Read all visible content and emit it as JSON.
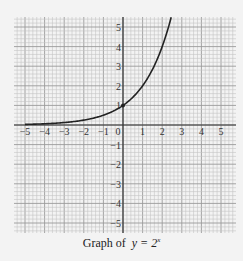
{
  "caption": {
    "prefix": "Graph of",
    "equation": "y = 2",
    "exponent": "x"
  },
  "chart_data": {
    "type": "line",
    "function": "y = 2^x",
    "xlabel": "",
    "ylabel": "",
    "xlim": [
      -5.5,
      5.5
    ],
    "ylim": [
      -5.5,
      5.5
    ],
    "grid": true,
    "minor_grid_per_unit": 5,
    "x_tick_labels": [
      "-5",
      "-4",
      "-3",
      "-2",
      "-1",
      "0",
      "1",
      "2",
      "3",
      "4",
      "5"
    ],
    "y_tick_labels": [
      "5",
      "4",
      "3",
      "2",
      "1",
      "-1",
      "-2",
      "-3",
      "-4",
      "-5"
    ],
    "series": [
      {
        "name": "y = 2^x",
        "x": [
          -5,
          -4,
          -3,
          -2,
          -1,
          0,
          1,
          2,
          2.46
        ],
        "y": [
          0.03125,
          0.0625,
          0.125,
          0.25,
          0.5,
          1,
          2,
          4,
          5.5
        ]
      }
    ],
    "marked_points": [
      {
        "x": 0,
        "y": 1
      }
    ],
    "legend": "none"
  },
  "colors": {
    "background": "#f3f3f3",
    "grid_minor": "#c4c4c4",
    "grid_major": "#9a9a9a",
    "axis": "#333333",
    "curve": "#222222"
  }
}
